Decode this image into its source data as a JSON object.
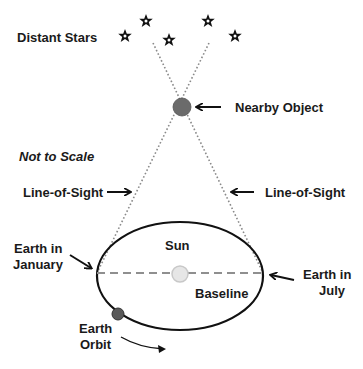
{
  "labels": {
    "distant_stars": "Distant Stars",
    "nearby_object": "Nearby Object",
    "not_to_scale": "Not to Scale",
    "line_of_sight_left": "Line-of-Sight",
    "line_of_sight_right": "Line-of-Sight",
    "earth_january_line1": "Earth in",
    "earth_january_line2": "January",
    "earth_july_line1": "Earth in",
    "earth_july_line2": "July",
    "sun": "Sun",
    "baseline": "Baseline",
    "earth_orbit_line1": "Earth",
    "earth_orbit_line2": "Orbit"
  },
  "colors": {
    "text": "#1a1a1a",
    "orbit": "#111111",
    "sight_line": "#8a8a8a",
    "baseline": "#8f8f8f",
    "nearby_object": "#6b6b6b",
    "sun_fill": "#e6e6e6",
    "sun_stroke": "#c8c8c8",
    "earth": "#5a5a5a"
  },
  "icons": {
    "stars": [
      "star-icon",
      "star-icon",
      "star-icon",
      "star-icon",
      "star-icon"
    ]
  }
}
